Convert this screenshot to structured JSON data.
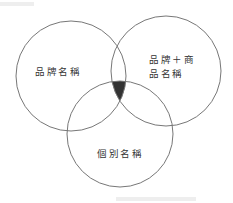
{
  "diagram": {
    "type": "venn",
    "stroke_color": "#777777",
    "intersection_fill": "#333333",
    "circles": [
      {
        "id": "brand-name",
        "label": "品牌名稱",
        "cx": 71,
        "cy": 76,
        "r": 55
      },
      {
        "id": "brand-plus-product-name",
        "label_line1": "品牌＋商",
        "label_line2": "品名稱",
        "cx": 166,
        "cy": 71,
        "r": 55
      },
      {
        "id": "individual-name",
        "label": "個別名稱",
        "cx": 120,
        "cy": 134,
        "r": 53
      }
    ],
    "highlighted_region": "intersection of all three circles"
  }
}
